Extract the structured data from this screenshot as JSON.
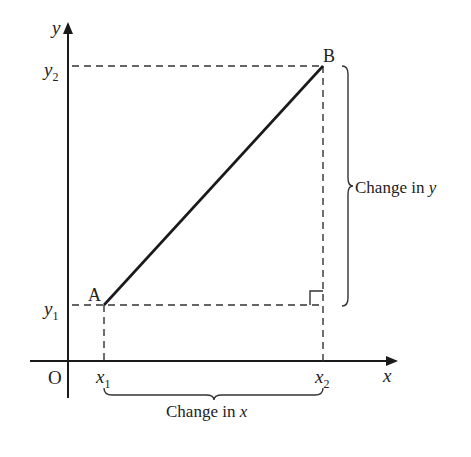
{
  "diagram": {
    "axes": {
      "x_label": "x",
      "y_label": "y",
      "origin_label": "O"
    },
    "points": {
      "A": {
        "label": "A",
        "x_label": "x",
        "x_sub": "1",
        "y_label": "y",
        "y_sub": "1"
      },
      "B": {
        "label": "B",
        "x_label": "x",
        "x_sub": "2",
        "y_label": "y",
        "y_sub": "2"
      }
    },
    "braces": {
      "horizontal": {
        "label_text": "Change in ",
        "label_var": "x"
      },
      "vertical": {
        "label_text": "Change in ",
        "label_var": "y"
      }
    },
    "colors": {
      "line": "#1a1a1a",
      "dashed": "#333333",
      "text": "#222222"
    }
  }
}
